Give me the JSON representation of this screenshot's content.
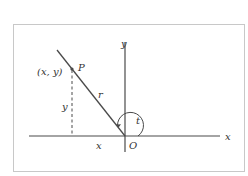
{
  "diagram": {
    "type": "unit-circle-angle-figure",
    "colors": {
      "background": "#ffffff",
      "frame": "#c8c8c8",
      "stroke": "#4a4a4a",
      "text": "#333333"
    },
    "labels": {
      "y_axis": "y",
      "x_axis": "x",
      "origin": "O",
      "point_name": "P",
      "point_coords": "(x, y)",
      "radius": "r",
      "angle": "t",
      "vertical_segment": "y",
      "horizontal_segment": "x"
    },
    "geometry": {
      "frame": [
        13,
        24,
        244,
        171
      ],
      "origin": [
        125,
        136
      ],
      "point_P": [
        72,
        69
      ],
      "ray_start": [
        57,
        50
      ]
    }
  }
}
